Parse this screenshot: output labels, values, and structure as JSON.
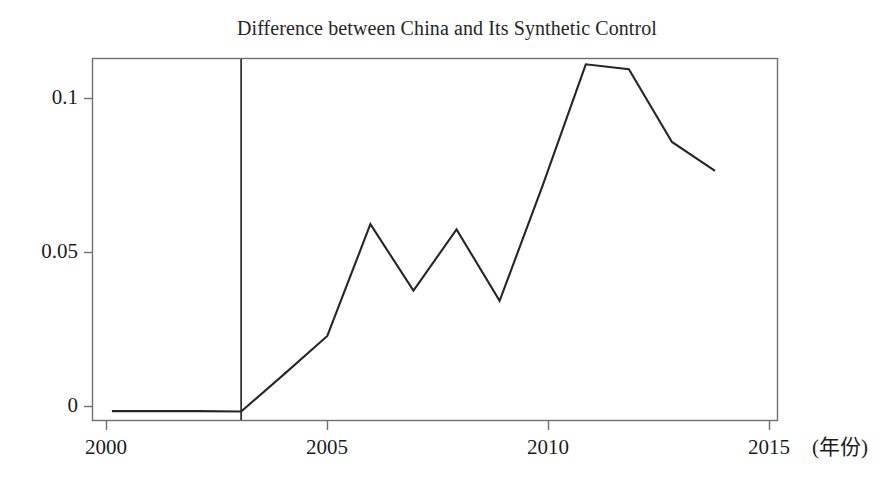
{
  "chart_data": {
    "type": "line",
    "title": "Difference between China and Its Synthetic Control",
    "xlabel": "(年份)",
    "ylabel": "",
    "x": [
      2000,
      2001,
      2002,
      2003,
      2004,
      2005,
      2006,
      2007,
      2008,
      2009,
      2010,
      2011,
      2012,
      2013,
      2014
    ],
    "values": [
      -0.0015,
      -0.0015,
      -0.0015,
      -0.0016,
      0.0105,
      0.0229,
      0.0592,
      0.0376,
      0.0575,
      0.0343,
      0.0718,
      0.1111,
      0.1095,
      0.0859,
      0.0765
    ],
    "series": [
      {
        "name": "China minus Synthetic Control",
        "values": [
          -0.0015,
          -0.0015,
          -0.0015,
          -0.0016,
          0.0105,
          0.0229,
          0.0592,
          0.0376,
          0.0575,
          0.0343,
          0.0718,
          0.1111,
          0.1095,
          0.0859,
          0.0765
        ]
      }
    ],
    "xlim": [
      1999.55,
      2015.45
    ],
    "ylim": [
      -0.0045,
      0.1152
    ],
    "xticks": [
      2000,
      2005,
      2010,
      2015
    ],
    "xtick_labels": [
      "2000",
      "2005",
      "2010",
      "2015"
    ],
    "yticks": [
      0,
      0.05,
      0.1
    ],
    "ytick_labels": [
      "0",
      "0.05",
      "0.1"
    ],
    "grid": false,
    "legend": null,
    "legend_position": "none",
    "line_color": "#262626",
    "frame_color": "#6b6b6b",
    "annotations": [
      {
        "type": "vline",
        "x": 2003,
        "label": "",
        "description": "vertical intervention line at year 2003"
      }
    ]
  },
  "axis": {
    "x_unit_suffix": "(年份)",
    "first_x_label": "2000",
    "last_x_label": "2015"
  }
}
